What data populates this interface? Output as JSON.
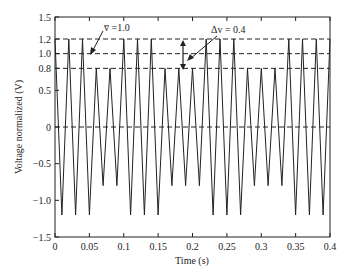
{
  "chart_data": {
    "type": "line",
    "title": "",
    "xlabel": "Time (s)",
    "ylabel": "Voltage normalized (V)",
    "xlim": [
      0,
      0.4
    ],
    "ylim": [
      -1.5,
      1.5
    ],
    "grid": false,
    "legend": null,
    "x_ticks": [
      0,
      0.05,
      0.1,
      0.15,
      0.2,
      0.25,
      0.3,
      0.35,
      0.4
    ],
    "x_tick_labels": [
      "0",
      "0.05",
      "0.1",
      "0.15",
      "0.2",
      "0.25",
      "0.3",
      "0.35",
      "0.4"
    ],
    "y_ticks": [
      -1.5,
      -1.0,
      -0.5,
      0,
      0.5,
      0.8,
      1.0,
      1.2,
      1.5
    ],
    "y_tick_labels": [
      "−1.5",
      "−1.0",
      "−0.5",
      "0",
      "0.5",
      "0.8",
      "1.0",
      "1.2",
      "1.5"
    ],
    "reference_lines": [
      {
        "y": 1.2,
        "style": "dashed"
      },
      {
        "y": 1.0,
        "style": "dashed"
      },
      {
        "y": 0.8,
        "style": "dashed"
      },
      {
        "y": 0,
        "style": "dashed"
      }
    ],
    "series": [
      {
        "name": "Normalized voltage (triangle wave, switching amplitude)",
        "period_s": 0.02,
        "cycle_amplitudes": [
          1.2,
          1.2,
          1.2,
          0.8,
          0.8,
          1.2,
          1.2,
          1.2,
          0.8,
          0.8,
          0.8,
          1.2,
          1.2,
          1.2,
          0.8,
          0.8,
          0.8,
          1.2,
          1.2,
          1.2
        ]
      }
    ],
    "annotations": [
      {
        "text": "v̅ = 1.0",
        "label": "mean voltage",
        "value": 1.0
      },
      {
        "text": "Δv = 0.4",
        "label": "voltage swing",
        "value": 0.4
      }
    ]
  },
  "labels": {
    "xlabel": "Time (s)",
    "ylabel": "Voltage normalized (V)",
    "annot_mean": "v̅ =1.0",
    "annot_delta": "Δv = 0.4"
  }
}
